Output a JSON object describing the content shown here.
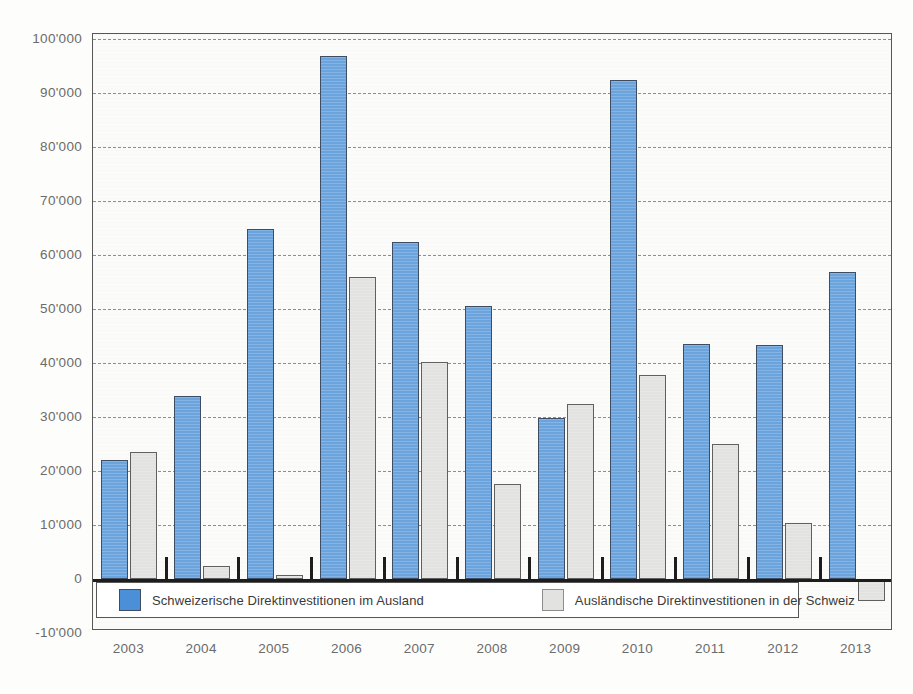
{
  "top_partial_text": "",
  "chart_data": {
    "type": "bar",
    "title": "",
    "subtitle": "",
    "xlabel": "",
    "ylabel": "",
    "categories": [
      "2003",
      "2004",
      "2005",
      "2006",
      "2007",
      "2008",
      "2009",
      "2010",
      "2011",
      "2012",
      "2013"
    ],
    "series": [
      {
        "name": "Schweizerische Direktinvestitionen im Ausland",
        "color": "#6ba3dd",
        "values": [
          22000,
          33800,
          64800,
          96800,
          62400,
          50500,
          29800,
          92500,
          43600,
          43300,
          56800
        ]
      },
      {
        "name": "Ausländische Direktinvestitionen in der Schweiz",
        "color": "#e2e2e0",
        "values": [
          23500,
          2500,
          800,
          56000,
          40200,
          17600,
          32400,
          37800,
          25000,
          10400,
          -4000
        ]
      }
    ],
    "ylim": [
      -10000,
      100000
    ],
    "ytick_values": [
      100000,
      90000,
      80000,
      70000,
      60000,
      50000,
      40000,
      30000,
      20000,
      10000,
      0,
      -10000
    ],
    "ytick_labels": [
      "100'000",
      "90'000",
      "80'000",
      "70'000",
      "60'000",
      "50'000",
      "40'000",
      "30'000",
      "20'000",
      "10'000",
      "0",
      "-10'000"
    ],
    "grid": true,
    "grid_style": "dashed-horizontal",
    "zero_line": true,
    "legend_position": "inside-bottom"
  },
  "legend": {
    "entries": [
      {
        "label": "Schweizerische Direktinvestitionen im Ausland",
        "swatch": "blue"
      },
      {
        "label": "Ausländische Direktinvestitionen in der Schweiz",
        "swatch": "grey"
      }
    ]
  }
}
